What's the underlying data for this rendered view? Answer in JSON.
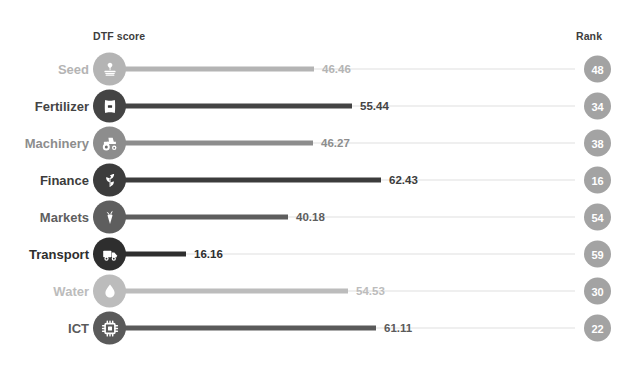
{
  "header": {
    "value_column_label": "DTF score",
    "rank_column_label": "Rank"
  },
  "chart_data": {
    "type": "bar",
    "title": "",
    "subtitle": "",
    "xlabel": "DTF score",
    "ylabel": "",
    "categories": [
      "Seed",
      "Fertilizer",
      "Machinery",
      "Finance",
      "Markets",
      "Transport",
      "Water",
      "ICT"
    ],
    "values": [
      46.46,
      55.44,
      46.27,
      62.43,
      40.18,
      16.16,
      54.53,
      61.11
    ],
    "value_labels": [
      "46.46",
      "55.44",
      "46.27",
      "62.43",
      "40.18",
      "16.16",
      "54.53",
      "61.11"
    ],
    "ranks": [
      48,
      34,
      38,
      16,
      54,
      59,
      30,
      22
    ],
    "rank_labels": [
      "48",
      "34",
      "38",
      "16",
      "54",
      "59",
      "30",
      "22"
    ],
    "xlim": [
      0,
      100
    ],
    "grid": false,
    "legend": "none",
    "orientation": "horizontal",
    "style": "lollipop"
  },
  "rows": [
    {
      "label": "Seed",
      "icon": "seed-sprout-icon",
      "value": 46.46,
      "value_label": "46.46",
      "rank": "48",
      "color": "#b4b4b4",
      "track_color": "#efefef"
    },
    {
      "label": "Fertilizer",
      "icon": "fertilizer-bag-icon",
      "value": 55.44,
      "value_label": "55.44",
      "rank": "34",
      "color": "#444444",
      "track_color": "#efefef"
    },
    {
      "label": "Machinery",
      "icon": "tractor-icon",
      "value": 46.27,
      "value_label": "46.27",
      "rank": "38",
      "color": "#8d8d8d",
      "track_color": "#efefef"
    },
    {
      "label": "Finance",
      "icon": "coin-plant-icon",
      "value": 62.43,
      "value_label": "62.43",
      "rank": "16",
      "color": "#3c3c3c",
      "track_color": "#efefef"
    },
    {
      "label": "Markets",
      "icon": "carrot-icon",
      "value": 40.18,
      "value_label": "40.18",
      "rank": "54",
      "color": "#5e5e5e",
      "track_color": "#efefef"
    },
    {
      "label": "Transport",
      "icon": "truck-icon",
      "value": 16.16,
      "value_label": "16.16",
      "rank": "59",
      "color": "#2e2e2e",
      "track_color": "#efefef"
    },
    {
      "label": "Water",
      "icon": "water-drop-icon",
      "value": 54.53,
      "value_label": "54.53",
      "rank": "30",
      "color": "#bcbcbc",
      "track_color": "#efefef"
    },
    {
      "label": "ICT",
      "icon": "microchip-icon",
      "value": 61.11,
      "value_label": "61.11",
      "rank": "22",
      "color": "#5a5a5a",
      "track_color": "#efefef"
    }
  ],
  "layout": {
    "first_row_top": 51,
    "row_step": 37,
    "stem_origin_x": 118,
    "px_per_unit": 4.22,
    "rank_badge_color": "#a3a3a3"
  }
}
